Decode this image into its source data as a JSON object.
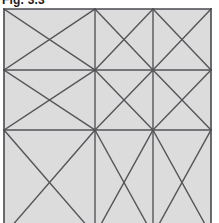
{
  "figure": {
    "caption": "Fig. 3.3",
    "caption_visible_note": "clipped at top edge",
    "background_color": "#ffffff",
    "cell_fill_color": "#dcdcdc",
    "line_color": "#55555a",
    "border_color": "#4a4a4f",
    "line_width": 1.4,
    "border_width": 1.6,
    "canvas": {
      "width": 219,
      "height": 223
    },
    "grid": {
      "left": 4,
      "right": 211,
      "top": 9,
      "bottom_visible": 223,
      "bottom_virtual": 235,
      "x_lines": [
        4,
        95,
        153,
        211
      ],
      "y_lines": [
        9,
        70,
        130,
        235
      ],
      "columns": 3,
      "rows": 3,
      "cropped_edges": [
        "bottom"
      ]
    },
    "panel_fill": {
      "x": 4,
      "y": 9,
      "width": 207,
      "height": 226
    },
    "vertical_lines": [
      {
        "name": "border-left",
        "x": 4,
        "y1": 9,
        "y2": 223,
        "is_border": true
      },
      {
        "name": "grid-vertical-1",
        "x": 95,
        "y1": 9,
        "y2": 223,
        "is_border": false
      },
      {
        "name": "grid-vertical-2",
        "x": 153,
        "y1": 9,
        "y2": 223,
        "is_border": false
      },
      {
        "name": "border-right",
        "x": 211,
        "y1": 9,
        "y2": 223,
        "is_border": true
      }
    ],
    "horizontal_lines": [
      {
        "name": "border-top",
        "y": 9,
        "x1": 4,
        "x2": 211,
        "is_border": true
      },
      {
        "name": "grid-horizontal-1",
        "y": 70,
        "x1": 4,
        "x2": 211,
        "is_border": false
      },
      {
        "name": "grid-horizontal-2",
        "y": 130,
        "x1": 4,
        "x2": 211,
        "is_border": false
      }
    ],
    "diagonals": [
      {
        "name": "row1-left-wide-down",
        "x1": 4,
        "y1": 9,
        "x2": 95,
        "y2": 70
      },
      {
        "name": "row1-left-wide-up",
        "x1": 4,
        "y1": 70,
        "x2": 95,
        "y2": 9
      },
      {
        "name": "row1-mid-down",
        "x1": 95,
        "y1": 9,
        "x2": 153,
        "y2": 70
      },
      {
        "name": "row1-mid-up",
        "x1": 95,
        "y1": 70,
        "x2": 153,
        "y2": 9
      },
      {
        "name": "row1-right-down",
        "x1": 153,
        "y1": 9,
        "x2": 211,
        "y2": 70
      },
      {
        "name": "row1-right-up",
        "x1": 153,
        "y1": 70,
        "x2": 211,
        "y2": 9
      },
      {
        "name": "row2-left-wide-down",
        "x1": 4,
        "y1": 70,
        "x2": 95,
        "y2": 130
      },
      {
        "name": "row2-left-wide-up",
        "x1": 4,
        "y1": 130,
        "x2": 95,
        "y2": 70
      },
      {
        "name": "row2-mid-down",
        "x1": 95,
        "y1": 70,
        "x2": 153,
        "y2": 130
      },
      {
        "name": "row2-mid-up",
        "x1": 95,
        "y1": 130,
        "x2": 153,
        "y2": 70
      },
      {
        "name": "row2-right-down",
        "x1": 153,
        "y1": 70,
        "x2": 211,
        "y2": 130
      },
      {
        "name": "row2-right-up",
        "x1": 153,
        "y1": 130,
        "x2": 211,
        "y2": 70
      },
      {
        "name": "row3-left-wide-down",
        "x1": 4,
        "y1": 130,
        "x2": 95,
        "y2": 235
      },
      {
        "name": "row3-left-wide-up",
        "x1": 4,
        "y1": 235,
        "x2": 95,
        "y2": 130
      },
      {
        "name": "row3-mid-down",
        "x1": 95,
        "y1": 130,
        "x2": 153,
        "y2": 235
      },
      {
        "name": "row3-mid-up",
        "x1": 95,
        "y1": 235,
        "x2": 153,
        "y2": 130
      },
      {
        "name": "row3-right-down",
        "x1": 153,
        "y1": 130,
        "x2": 211,
        "y2": 235
      },
      {
        "name": "row3-right-up",
        "x1": 153,
        "y1": 235,
        "x2": 211,
        "y2": 130
      }
    ],
    "nodes": [
      {
        "name": "node-c1-r1",
        "x": 95,
        "y": 70
      },
      {
        "name": "node-c2-r1",
        "x": 153,
        "y": 70
      },
      {
        "name": "node-c1-r2",
        "x": 95,
        "y": 130
      },
      {
        "name": "node-c2-r2",
        "x": 153,
        "y": 130
      }
    ]
  }
}
